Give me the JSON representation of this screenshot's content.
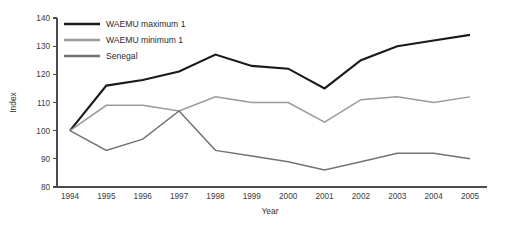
{
  "chart_data": {
    "type": "line",
    "title": "",
    "xlabel": "Year",
    "ylabel": "Index",
    "categories": [
      "1994",
      "1995",
      "1996",
      "1997",
      "1998",
      "1999",
      "2000",
      "2001",
      "2002",
      "2003",
      "2004",
      "2005"
    ],
    "x": [
      1994,
      1995,
      1996,
      1997,
      1998,
      1999,
      2000,
      2001,
      2002,
      2003,
      2004,
      2005
    ],
    "xlim": [
      1994,
      2005
    ],
    "ylim": [
      80,
      140
    ],
    "yticks": [
      80,
      90,
      100,
      110,
      120,
      130,
      140
    ],
    "ytick_labels": [
      "80",
      "90",
      "100",
      "110",
      "120",
      "130",
      "140"
    ],
    "grid": false,
    "legend_position": "top-left",
    "series": [
      {
        "name": "WAEMU maximum 1",
        "color": "#1a1a1a",
        "width": 2.1,
        "values": [
          100,
          116,
          118,
          121,
          127,
          123,
          122,
          115,
          125,
          130,
          132,
          134
        ]
      },
      {
        "name": "WAEMU minimum 1",
        "color": "#9a9a9a",
        "width": 1.5,
        "values": [
          100,
          109,
          109,
          107,
          112,
          110,
          110,
          103,
          111,
          112,
          110,
          112
        ]
      },
      {
        "name": "Senegal",
        "color": "#737373",
        "width": 1.5,
        "values": [
          100,
          93,
          97,
          107,
          93,
          91,
          89,
          86,
          89,
          92,
          92,
          90
        ]
      }
    ]
  },
  "colors": {
    "axis": "#4d4d4d",
    "text": "#2f2f2f",
    "background": "#ffffff"
  }
}
